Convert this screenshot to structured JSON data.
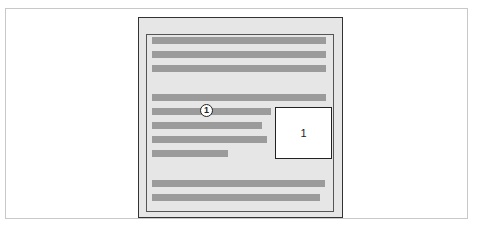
{
  "figure": {
    "callout_marker": "1",
    "floating_box_label": "1",
    "colors": {
      "page_fill": "#e6e6e6",
      "text_bar": "#9b9b9b",
      "box_fill": "#ffffff",
      "border": "#333333"
    },
    "text_lines": [
      {
        "top": 37,
        "width": 174
      },
      {
        "top": 51,
        "width": 174
      },
      {
        "top": 65,
        "width": 174
      },
      {
        "top": 94,
        "width": 174
      },
      {
        "top": 108,
        "width": 119
      },
      {
        "top": 122,
        "width": 110
      },
      {
        "top": 136,
        "width": 115
      },
      {
        "top": 150,
        "width": 76
      },
      {
        "top": 180,
        "width": 173
      },
      {
        "top": 194,
        "width": 168
      }
    ]
  }
}
